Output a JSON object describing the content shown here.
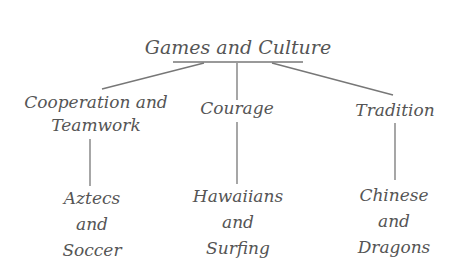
{
  "diagram": {
    "type": "tree",
    "root": {
      "label": "Games and Culture"
    },
    "categories": [
      {
        "label_lines": [
          "Cooperation and",
          "Teamwork"
        ],
        "example_lines": [
          "Aztecs",
          "and",
          "Soccer"
        ]
      },
      {
        "label_lines": [
          "Courage"
        ],
        "example_lines": [
          "Hawaiians",
          "and",
          "Surfing"
        ]
      },
      {
        "label_lines": [
          "Tradition"
        ],
        "example_lines": [
          "Chinese",
          "and",
          "Dragons"
        ]
      }
    ],
    "colors": {
      "ink": "#555555",
      "lines": "#777777",
      "background": "#ffffff"
    }
  }
}
